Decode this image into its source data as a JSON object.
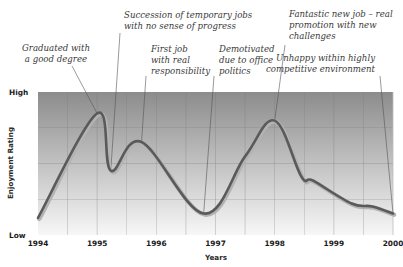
{
  "chart_data": {
    "type": "line",
    "title": "",
    "xlabel": "Years",
    "ylabel": "Enjoyment Rating",
    "x_ticks": [
      "1994",
      "1995",
      "1996",
      "1997",
      "1998",
      "1999",
      "2000"
    ],
    "y_ticks": [
      "Low",
      "High"
    ],
    "xlim": [
      1994,
      2000
    ],
    "ylim": [
      0,
      10
    ],
    "grid": true,
    "legend": null,
    "series": [
      {
        "name": "Enjoyment",
        "x": [
          1994.0,
          1995.0,
          1995.23,
          1995.75,
          1996.8,
          1997.5,
          1998.0,
          1998.45,
          1998.65,
          1999.3,
          1999.65,
          2000.0
        ],
        "y": [
          1.2,
          8.5,
          4.5,
          6.5,
          1.5,
          5.5,
          8.0,
          4.1,
          3.8,
          2.2,
          2.0,
          1.5
        ]
      }
    ],
    "annotations": [
      {
        "lines": [
          "Graduated with",
          "a good degree"
        ],
        "x": 1995.0,
        "y": 8.5,
        "tx": 56,
        "ty": [
          51,
          62
        ],
        "anchor": "middle",
        "lx1": 72,
        "ly1": 66
      },
      {
        "lines": [
          "Succession of temporary jobs",
          "with no sense of progress"
        ],
        "x": 1995.23,
        "y": 4.5,
        "tx": 124,
        "ty": [
          18,
          29
        ],
        "anchor": "start",
        "lx1": 120,
        "ly1": 33
      },
      {
        "lines": [
          "First job",
          "with real",
          "responsibility"
        ],
        "x": 1995.75,
        "y": 6.5,
        "tx": 151,
        "ty": [
          52,
          63,
          74
        ],
        "anchor": "start",
        "lx1": 146,
        "ly1": 76
      },
      {
        "lines": [
          "Demotivated",
          "due to office",
          "politics"
        ],
        "x": 1996.8,
        "y": 1.5,
        "tx": 219,
        "ty": [
          52,
          63,
          74
        ],
        "anchor": "start",
        "lx1": 214,
        "ly1": 76
      },
      {
        "lines": [
          "Fantastic new job – real",
          "promotion with new",
          "challenges"
        ],
        "x": 1998.0,
        "y": 8.0,
        "tx": 289,
        "ty": [
          17,
          28,
          39
        ],
        "anchor": "start",
        "lx1": 285,
        "ly1": 45
      },
      {
        "lines": [
          "Unhappy within highly",
          "competitive environment"
        ],
        "x": 2000.0,
        "y": 1.5,
        "tx": 375,
        "ty": [
          61,
          72
        ],
        "anchor": "end",
        "lx1": 380,
        "ly1": 76
      }
    ]
  },
  "colors": {
    "line": "#5a5a5a",
    "line_shadow": "#b3b3b3",
    "plot_top": "#8c8c8c",
    "plot_bottom": "#f7f7f7",
    "grid": "#7a7a7a",
    "leader": "#555555"
  }
}
